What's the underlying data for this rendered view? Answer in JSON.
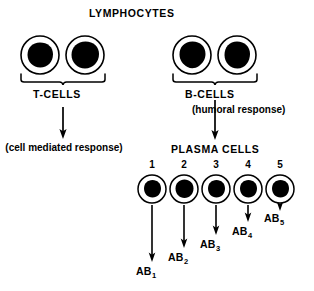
{
  "diagram": {
    "title": "LYMPHOCYTES",
    "background_color": "#ffffff",
    "ink_color": "#000000",
    "headings": {
      "lymphocytes": "LYMPHOCYTES",
      "t_cells": "T-CELLS",
      "b_cells": "B-CELLS",
      "plasma_cells": "PLASMA CELLS"
    },
    "annotations": {
      "cell_mediated": "(cell mediated response)",
      "humoral": "(humoral response)"
    },
    "lymphocyte_cells": [
      {
        "group": "t-cell",
        "index": 1,
        "cx": 40,
        "cy": 55,
        "r_outer": 19,
        "r_inner": 12.5
      },
      {
        "group": "t-cell",
        "index": 2,
        "cx": 85,
        "cy": 55,
        "r_outer": 19,
        "r_inner": 13.5
      },
      {
        "group": "b-cell",
        "index": 1,
        "cx": 192,
        "cy": 55,
        "r_outer": 19,
        "r_inner": 13.5
      },
      {
        "group": "b-cell",
        "index": 2,
        "cx": 237,
        "cy": 55,
        "r_outer": 19,
        "r_inner": 13
      }
    ],
    "plasma_cells": [
      {
        "number": "1",
        "cx": 152,
        "cy": 189,
        "r_outer": 14,
        "r_inner": 9
      },
      {
        "number": "2",
        "cx": 184,
        "cy": 189,
        "r_outer": 14,
        "r_inner": 9.5
      },
      {
        "number": "3",
        "cx": 216,
        "cy": 189,
        "r_outer": 14,
        "r_inner": 9
      },
      {
        "number": "4",
        "cx": 248,
        "cy": 189,
        "r_outer": 14,
        "r_inner": 9
      },
      {
        "number": "5",
        "cx": 280,
        "cy": 189,
        "r_outer": 14,
        "r_inner": 9
      }
    ],
    "antibody_labels": [
      {
        "name": "AB",
        "subscript": "1",
        "x": 138,
        "y": 272
      },
      {
        "name": "AB",
        "subscript": "2",
        "x": 170,
        "y": 258
      },
      {
        "name": "AB",
        "subscript": "3",
        "x": 202,
        "y": 245
      },
      {
        "name": "AB",
        "subscript": "4",
        "x": 234,
        "y": 232
      },
      {
        "name": "AB",
        "subscript": "5",
        "x": 266,
        "y": 219
      }
    ],
    "antibody_arrows": [
      {
        "x": 152,
        "y1": 205,
        "y2": 262
      },
      {
        "x": 184,
        "y1": 205,
        "y2": 248
      },
      {
        "x": 216,
        "y1": 205,
        "y2": 235
      },
      {
        "x": 248,
        "y1": 205,
        "y2": 222
      },
      {
        "x": 280,
        "y1": 205,
        "y2": 209
      }
    ],
    "flow_arrows": [
      {
        "name": "t-cells-to-response",
        "x": 63,
        "y1": 107,
        "y2": 137
      },
      {
        "name": "b-cells-to-plasma-cells",
        "x": 215,
        "y1": 100,
        "y2": 138
      }
    ],
    "braces": [
      {
        "name": "t-cells-brace",
        "x1": 21,
        "x2": 105,
        "y": 80,
        "tip_x": 63
      },
      {
        "name": "b-cells-brace",
        "x1": 173,
        "x2": 257,
        "y": 80,
        "tip_x": 215
      }
    ]
  }
}
